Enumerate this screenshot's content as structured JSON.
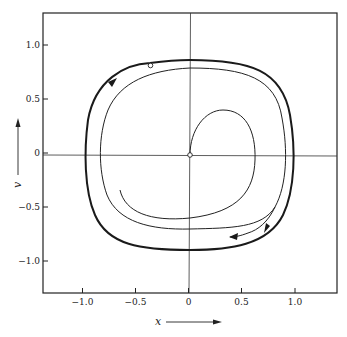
{
  "figure": {
    "type": "phase-portrait",
    "xlabel": "x",
    "ylabel": "v",
    "x_ticks": [
      {
        "value": -1.0,
        "label": "−1.0"
      },
      {
        "value": -0.5,
        "label": "−0.5"
      },
      {
        "value": 0,
        "label": "0"
      },
      {
        "value": 0.5,
        "label": "0.5"
      },
      {
        "value": 1.0,
        "label": "1.0"
      }
    ],
    "y_ticks": [
      {
        "value": 1.0,
        "label": "1.0"
      },
      {
        "value": 0.5,
        "label": "0.5"
      },
      {
        "value": 0,
        "label": "0"
      },
      {
        "value": -0.5,
        "label": "−0.5"
      },
      {
        "value": -1.0,
        "label": "−1.0"
      }
    ],
    "xlim": [
      -1.4,
      1.4
    ],
    "ylim": [
      -1.3,
      1.3
    ],
    "colors": {
      "ink": "#222222",
      "background": "#ffffff"
    },
    "curves": [
      {
        "name": "limit-cycle",
        "style": "thick",
        "description": "outer closed orbit, clockwise",
        "extent": {
          "x": [
            -0.97,
            0.97
          ],
          "v": [
            -0.9,
            0.88
          ]
        }
      },
      {
        "name": "trajectory-from-outside",
        "style": "thin",
        "description": "inner spiral approaching limit cycle"
      },
      {
        "name": "trajectory-from-origin",
        "style": "thin",
        "description": "starts at origin, loops out toward limit cycle"
      }
    ],
    "markers": [
      {
        "name": "origin-point",
        "x": 0,
        "v": 0,
        "style": "open-circle"
      },
      {
        "name": "start-point-outer",
        "x": -0.36,
        "v": 0.83,
        "style": "open-circle"
      }
    ]
  }
}
